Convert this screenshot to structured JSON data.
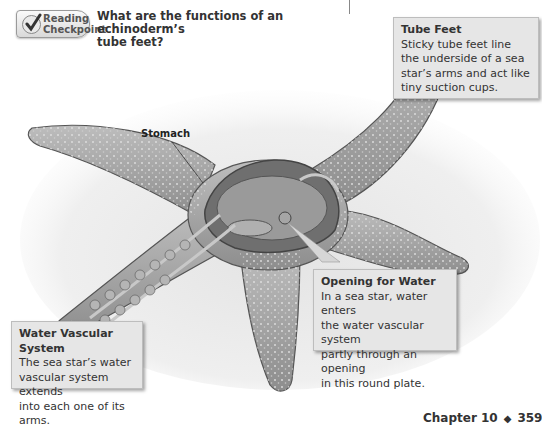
{
  "reading_checkpoint": {
    "badge_line1": "Reading",
    "badge_line2": "Checkpoint",
    "question_line1": "What are the functions of an echinoderm’s",
    "question_line2": "tube feet?"
  },
  "figure": {
    "labels": {
      "stomach": "Stomach"
    },
    "callouts": [
      {
        "title": "Tube Feet",
        "lines": [
          "Sticky tube feet line",
          "the underside of a sea",
          "star’s arms and act like",
          "tiny suction cups."
        ]
      },
      {
        "title": "Opening for Water",
        "lines": [
          "In a sea star, water enters",
          "the water vascular system",
          "partly through an opening",
          "in this round plate."
        ]
      },
      {
        "title": "Water Vascular System",
        "lines": [
          "The sea star’s water",
          "vascular system extends",
          "into each one of its arms."
        ]
      }
    ]
  },
  "footer": {
    "chapter": "Chapter 10",
    "separator": "◆",
    "page": "359"
  }
}
